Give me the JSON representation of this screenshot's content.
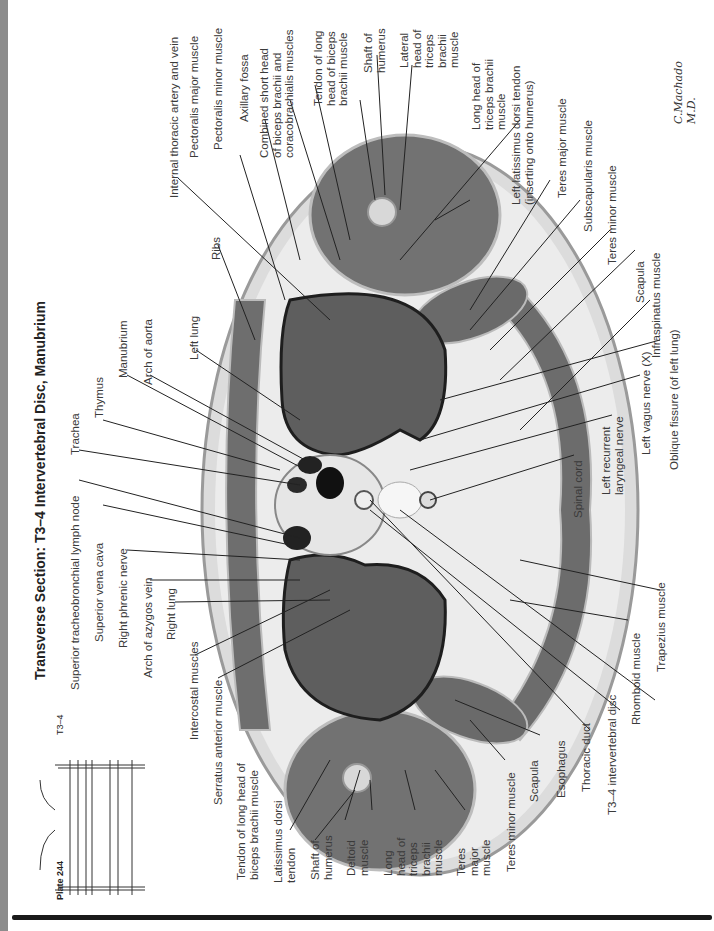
{
  "page": {
    "title": "Transverse Section: T3–4 Intervertebral Disc, Manubrium",
    "plate_number": "Plate 244",
    "level_indicator": "T3–4",
    "signature": "C.Machado M.D."
  },
  "labels": {
    "top_left": [
      "Internal thoracic artery and vein",
      "Ribs",
      "Left lung",
      "Arch of aorta",
      "Manubrium",
      "Thymus",
      "Trachea",
      "Superior tracheobronchial lymph node",
      "Superior vena cava",
      "Right phrenic nerve",
      "Arch of azygos vein",
      "Right lung",
      "Intercostal muscles",
      "Serratus anterior muscle"
    ],
    "top": [
      "Pectoralis major muscle",
      "Pectoralis minor muscle",
      "Axillary fossa",
      "Combined short head\nof biceps brachii and\ncoracobrachialis muscles",
      "Tendon of long\nhead of biceps\nbrachii muscle",
      "Shaft of\nhumerus",
      "Lateral\nhead of\ntriceps\nbrachii\nmuscle",
      "Long head of\ntriceps brachii\nmuscle",
      "Left latissimus dorsi tendon\n(inserting onto humerus)",
      "Teres major muscle",
      "Subscapularis muscle",
      "Teres minor muscle",
      "Scapula",
      "Infraspinatus muscle",
      "Oblique fissure (of left lung)",
      "Left vagus nerve (X)",
      "Left recurrent\nlaryngeal nerve",
      "Spinal cord"
    ],
    "bottom": [
      "Tendon of long head of\nbiceps brachii muscle",
      "Latissimus dorsi\ntendon",
      "Shaft of\nhumerus",
      "Deltoid\nmuscle",
      "Long\nhead of\ntriceps\nbrachii\nmuscle",
      "Teres\nmajor\nmuscle",
      "Teres minor muscle",
      "Scapula",
      "Esophagus",
      "Thoracic duct",
      "T3–4 intervertebral disc",
      "Rhomboid muscle",
      "Trapezius muscle"
    ]
  },
  "colors": {
    "edge_strip": "#8c8c8c",
    "rule": "#1a1a1a",
    "lung": "#5e5e5e",
    "muscle": "#6a6a6a",
    "fat": "#e4e4e4",
    "skin": "#c8c8c8"
  }
}
